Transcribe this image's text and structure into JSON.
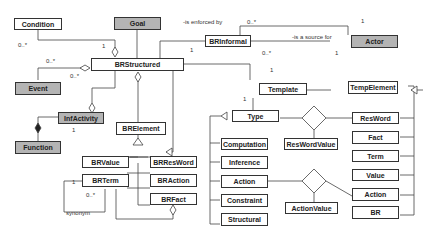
{
  "classes": {
    "condition": "Condition",
    "goal": "Goal",
    "brinformal": "BRInformal",
    "actor": "Actor",
    "brstructured": "BRStructured",
    "event": "Event",
    "infactivity": "InfActivity",
    "function": "Function",
    "brelement": "BRElement",
    "brvalue": "BRValue",
    "brresword": "BRResWord",
    "brterm": "BRTerm",
    "braction": "BRAction",
    "brfact": "BRFact",
    "template": "Template",
    "tempelement": "TempElement",
    "type": "Type",
    "reswordvalue": "ResWordValue",
    "computation": "Computation",
    "inference": "Inference",
    "action_type": "Action",
    "constraint": "Constraint",
    "structural": "Structural",
    "actionvalue": "ActionValue",
    "resword": "ResWord",
    "fact": "Fact",
    "term": "Term",
    "value": "Value",
    "action_elem": "Action",
    "br": "BR"
  },
  "labels": {
    "is_enforced_by": "-is enforced by",
    "is_source_for": "-is a source for",
    "synonym": "synonym"
  },
  "multiplicities": {
    "cond_many": "0..*",
    "cond_one": "1",
    "event_many1": "0..*",
    "event_many2": "0..*",
    "enf_many": "0..*",
    "enf_one": "1",
    "src_many": "0..*",
    "src_one": "1",
    "star": "*",
    "one": "1",
    "syn_one": "1",
    "syn_many": "0..*"
  },
  "colors": {
    "gray_fill": "#b4b4b4",
    "line": "#333333"
  }
}
